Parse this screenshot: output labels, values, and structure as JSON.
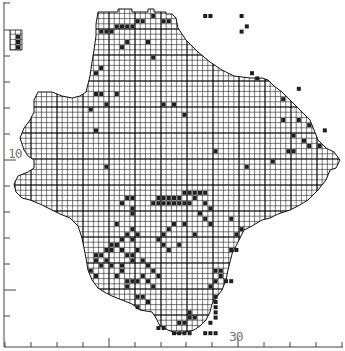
{
  "map": {
    "type": "grid distribution map",
    "grid_cell_px": 5.2,
    "origin_px": [
      5,
      3
    ],
    "ink_color": "#1a1a1a",
    "grid_color": "#222222",
    "record_color": "#1f1f1f",
    "axes": {
      "x_label_30": "30",
      "y_label_10": "10",
      "x_ticks_px": [
        5,
        31,
        57,
        83,
        109,
        135,
        161,
        186,
        212,
        238,
        264,
        290,
        316,
        342
      ],
      "x_major_ticks_px": [
        109,
        238
      ],
      "y_ticks_px": [
        3,
        30,
        56,
        82,
        108,
        134,
        160,
        186,
        212,
        238,
        264,
        290,
        316
      ],
      "y_major_ticks_px": [
        160,
        290
      ]
    },
    "outline": [
      [
        98,
        12
      ],
      [
        118,
        12
      ],
      [
        118,
        9
      ],
      [
        132,
        9
      ],
      [
        132,
        12
      ],
      [
        148,
        12
      ],
      [
        148,
        9
      ],
      [
        154,
        9
      ],
      [
        154,
        12
      ],
      [
        166,
        12
      ],
      [
        166,
        14
      ],
      [
        172,
        14
      ],
      [
        176,
        18
      ],
      [
        178,
        28
      ],
      [
        186,
        40
      ],
      [
        198,
        52
      ],
      [
        210,
        62
      ],
      [
        222,
        70
      ],
      [
        234,
        76
      ],
      [
        250,
        78
      ],
      [
        262,
        78
      ],
      [
        268,
        80
      ],
      [
        274,
        86
      ],
      [
        282,
        92
      ],
      [
        290,
        100
      ],
      [
        300,
        110
      ],
      [
        310,
        120
      ],
      [
        314,
        130
      ],
      [
        318,
        140
      ],
      [
        326,
        148
      ],
      [
        334,
        152
      ],
      [
        340,
        160
      ],
      [
        336,
        168
      ],
      [
        330,
        170
      ],
      [
        326,
        180
      ],
      [
        318,
        190
      ],
      [
        308,
        200
      ],
      [
        298,
        206
      ],
      [
        290,
        210
      ],
      [
        278,
        214
      ],
      [
        270,
        218
      ],
      [
        262,
        220
      ],
      [
        252,
        226
      ],
      [
        244,
        230
      ],
      [
        240,
        238
      ],
      [
        236,
        246
      ],
      [
        232,
        254
      ],
      [
        230,
        262
      ],
      [
        228,
        270
      ],
      [
        226,
        280
      ],
      [
        222,
        290
      ],
      [
        216,
        298
      ],
      [
        212,
        304
      ],
      [
        210,
        312
      ],
      [
        206,
        320
      ],
      [
        200,
        326
      ],
      [
        194,
        330
      ],
      [
        186,
        332
      ],
      [
        178,
        334
      ],
      [
        168,
        330
      ],
      [
        160,
        326
      ],
      [
        156,
        318
      ],
      [
        152,
        312
      ],
      [
        140,
        310
      ],
      [
        132,
        304
      ],
      [
        122,
        300
      ],
      [
        112,
        296
      ],
      [
        104,
        292
      ],
      [
        98,
        288
      ],
      [
        92,
        280
      ],
      [
        88,
        270
      ],
      [
        86,
        258
      ],
      [
        84,
        248
      ],
      [
        82,
        238
      ],
      [
        78,
        226
      ],
      [
        70,
        218
      ],
      [
        60,
        214
      ],
      [
        52,
        210
      ],
      [
        40,
        204
      ],
      [
        30,
        200
      ],
      [
        22,
        198
      ],
      [
        16,
        192
      ],
      [
        14,
        184
      ],
      [
        18,
        176
      ],
      [
        28,
        172
      ],
      [
        34,
        168
      ],
      [
        34,
        160
      ],
      [
        28,
        156
      ],
      [
        24,
        150
      ],
      [
        22,
        144
      ],
      [
        20,
        138
      ],
      [
        24,
        128
      ],
      [
        30,
        120
      ],
      [
        34,
        112
      ],
      [
        34,
        100
      ],
      [
        38,
        92
      ],
      [
        52,
        92
      ],
      [
        62,
        96
      ],
      [
        72,
        98
      ],
      [
        80,
        96
      ],
      [
        86,
        92
      ],
      [
        88,
        84
      ],
      [
        90,
        76
      ],
      [
        92,
        62
      ],
      [
        94,
        50
      ],
      [
        96,
        36
      ],
      [
        96,
        24
      ],
      [
        98,
        12
      ]
    ],
    "island_outline": [
      [
        10,
        30
      ],
      [
        22,
        30
      ],
      [
        22,
        50
      ],
      [
        10,
        50
      ]
    ],
    "records_cells": [
      [
        2,
        6
      ],
      [
        2,
        7
      ],
      [
        2,
        8
      ],
      [
        18,
        5
      ],
      [
        19,
        5
      ],
      [
        20,
        5
      ],
      [
        21,
        4
      ],
      [
        22,
        4
      ],
      [
        23,
        4
      ],
      [
        24,
        4
      ],
      [
        25,
        3
      ],
      [
        26,
        3
      ],
      [
        28,
        2
      ],
      [
        30,
        3
      ],
      [
        31,
        3
      ],
      [
        38,
        2
      ],
      [
        39,
        2
      ],
      [
        45,
        2
      ],
      [
        46,
        4
      ],
      [
        45,
        5
      ],
      [
        23,
        7
      ],
      [
        22,
        8
      ],
      [
        27,
        7
      ],
      [
        28,
        10
      ],
      [
        18,
        12
      ],
      [
        17,
        13
      ],
      [
        17,
        17
      ],
      [
        18,
        17
      ],
      [
        30,
        19
      ],
      [
        32,
        19
      ],
      [
        34,
        21
      ],
      [
        47,
        13
      ],
      [
        48,
        14
      ],
      [
        21,
        17
      ],
      [
        17,
        24
      ],
      [
        19,
        31
      ],
      [
        16,
        20
      ],
      [
        19,
        19
      ],
      [
        53,
        18
      ],
      [
        56,
        16
      ],
      [
        56,
        22
      ],
      [
        53,
        22
      ],
      [
        58,
        23
      ],
      [
        55,
        25
      ],
      [
        61,
        24
      ],
      [
        60,
        27
      ],
      [
        40,
        28
      ],
      [
        51,
        30
      ],
      [
        46,
        31
      ],
      [
        29,
        37
      ],
      [
        30,
        37
      ],
      [
        31,
        37
      ],
      [
        32,
        37
      ],
      [
        33,
        37
      ],
      [
        34,
        36
      ],
      [
        35,
        36
      ],
      [
        36,
        36
      ],
      [
        37,
        36
      ],
      [
        38,
        36
      ],
      [
        28,
        38
      ],
      [
        29,
        38
      ],
      [
        30,
        38
      ],
      [
        31,
        38
      ],
      [
        32,
        38
      ],
      [
        33,
        38
      ],
      [
        34,
        38
      ],
      [
        35,
        38
      ],
      [
        36,
        37
      ],
      [
        38,
        38
      ],
      [
        39,
        39
      ],
      [
        37,
        40
      ],
      [
        38,
        41
      ],
      [
        32,
        42
      ],
      [
        31,
        43
      ],
      [
        30,
        44
      ],
      [
        29,
        45
      ],
      [
        30,
        46
      ],
      [
        33,
        46
      ],
      [
        34,
        42
      ],
      [
        36,
        44
      ],
      [
        39,
        42
      ],
      [
        31,
        47
      ],
      [
        23,
        37
      ],
      [
        24,
        37
      ],
      [
        22,
        38
      ],
      [
        24,
        39
      ],
      [
        24,
        40
      ],
      [
        21,
        42
      ],
      [
        24,
        43
      ],
      [
        23,
        44
      ],
      [
        22,
        45
      ],
      [
        21,
        46
      ],
      [
        20,
        46
      ],
      [
        20,
        47
      ],
      [
        22,
        47
      ],
      [
        23,
        48
      ],
      [
        24,
        48
      ],
      [
        25,
        47
      ],
      [
        19,
        47
      ],
      [
        17,
        48
      ],
      [
        18,
        48
      ],
      [
        17,
        49
      ],
      [
        19,
        49
      ],
      [
        20,
        50
      ],
      [
        22,
        50
      ],
      [
        22,
        51
      ],
      [
        21,
        52
      ],
      [
        23,
        53
      ],
      [
        24,
        53
      ],
      [
        25,
        53
      ],
      [
        23,
        54
      ],
      [
        18,
        50
      ],
      [
        16,
        51
      ],
      [
        17,
        52
      ],
      [
        24,
        49
      ],
      [
        26,
        49
      ],
      [
        27,
        50
      ],
      [
        28,
        51
      ],
      [
        29,
        52
      ],
      [
        26,
        52
      ],
      [
        27,
        53
      ],
      [
        28,
        54
      ],
      [
        21,
        46
      ],
      [
        24,
        45
      ],
      [
        25,
        44
      ],
      [
        40,
        51
      ],
      [
        41,
        51
      ],
      [
        41,
        52
      ],
      [
        40,
        53
      ],
      [
        39,
        54
      ],
      [
        25,
        56
      ],
      [
        26,
        56
      ],
      [
        27,
        57
      ],
      [
        25,
        58
      ],
      [
        33,
        61
      ],
      [
        34,
        61
      ],
      [
        35,
        60
      ],
      [
        36,
        60
      ],
      [
        35,
        59
      ],
      [
        29,
        62
      ],
      [
        30,
        62
      ],
      [
        40,
        56
      ],
      [
        40,
        57
      ],
      [
        40,
        58
      ],
      [
        40,
        59
      ],
      [
        40,
        60
      ],
      [
        39,
        61
      ],
      [
        42,
        53
      ],
      [
        43,
        53
      ],
      [
        43,
        47
      ],
      [
        44,
        47
      ],
      [
        45,
        43
      ],
      [
        44,
        44
      ],
      [
        43,
        41
      ],
      [
        32,
        63
      ],
      [
        33,
        63
      ],
      [
        34,
        63
      ],
      [
        35,
        63
      ],
      [
        38,
        63
      ],
      [
        39,
        63
      ],
      [
        40,
        63
      ],
      [
        54,
        28
      ],
      [
        55,
        28
      ],
      [
        57,
        26
      ],
      [
        58,
        27
      ]
    ]
  }
}
